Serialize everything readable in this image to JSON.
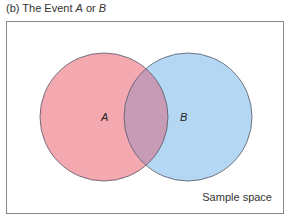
{
  "caption": {
    "prefix": "(b) The Event ",
    "italic_a": "A",
    "connector": " or ",
    "italic_b": "B"
  },
  "diagram": {
    "type": "venn",
    "sets": [
      {
        "name": "A",
        "label": "A",
        "fill": "#f4a9b1"
      },
      {
        "name": "B",
        "label": "B",
        "fill": "#b4d8f3"
      }
    ],
    "intersection_fill": "#c79ab5",
    "outline_color": "#555566",
    "universe_label": "Sample space",
    "universe_border": "#888888",
    "shaded": "A or B"
  }
}
